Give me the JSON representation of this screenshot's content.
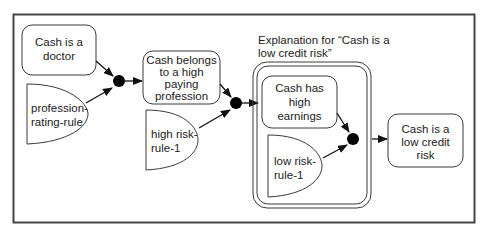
{
  "diagram": {
    "colors": {
      "stroke": "#3a3a3a",
      "frame": "#444444",
      "text": "#222222",
      "background": "#ffffff"
    },
    "caption": {
      "lines": [
        "Explanation for “Cash is a",
        "low credit risk”"
      ]
    },
    "nodes": {
      "doctor": {
        "type": "fact",
        "lines": [
          "Cash is a",
          "doctor"
        ]
      },
      "profession_rule": {
        "type": "rule",
        "lines": [
          "profession-",
          "rating-rule"
        ]
      },
      "high_paying": {
        "type": "fact",
        "lines": [
          "Cash belongs",
          "to a high",
          "paying",
          "profession"
        ]
      },
      "high_risk_rule": {
        "type": "rule",
        "lines": [
          "high risk-",
          "rule-1"
        ]
      },
      "high_earnings": {
        "type": "fact",
        "lines": [
          "Cash has",
          "high",
          "earnings"
        ]
      },
      "low_risk_rule": {
        "type": "rule",
        "lines": [
          "low risk-",
          "rule-1"
        ]
      },
      "low_credit_risk": {
        "type": "fact",
        "lines": [
          "Cash is a",
          "low credit",
          "risk"
        ]
      }
    },
    "junctions": [
      "junction-1",
      "junction-2",
      "junction-3"
    ],
    "edges": [
      {
        "from": "doctor",
        "to": "junction-1"
      },
      {
        "from": "profession_rule",
        "to": "junction-1"
      },
      {
        "from": "junction-1",
        "to": "high_paying"
      },
      {
        "from": "high_paying",
        "to": "junction-2"
      },
      {
        "from": "high_risk_rule",
        "to": "junction-2"
      },
      {
        "from": "junction-2",
        "to": "explanation_group"
      },
      {
        "from": "high_earnings",
        "to": "junction-3"
      },
      {
        "from": "low_risk_rule",
        "to": "junction-3"
      },
      {
        "from": "junction-3",
        "to": "low_credit_risk"
      }
    ]
  }
}
